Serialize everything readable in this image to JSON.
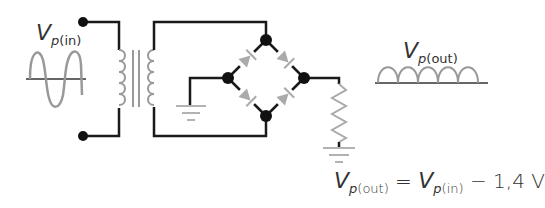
{
  "diagram": {
    "labels": {
      "input": {
        "main": "V",
        "sub_italic": "p",
        "sub_rest": "(in)"
      },
      "output": {
        "main": "V",
        "sub_italic": "p",
        "sub_rest": "(out)"
      }
    },
    "equation": {
      "lhs_main": "V",
      "lhs_sub_italic": "p",
      "lhs_sub_rest": "(out)",
      "equals": " = ",
      "rhs_main": "V",
      "rhs_sub_italic": "p",
      "rhs_sub_rest": "(in)",
      "rhs_tail": " − 1,4 V"
    },
    "components": [
      "ac-source",
      "transformer",
      "diode-bridge",
      "load-resistor",
      "ground",
      "ground"
    ],
    "colors": {
      "wire": "#1a1a1a",
      "component": "#a8a8a8",
      "text": "#333333"
    }
  }
}
